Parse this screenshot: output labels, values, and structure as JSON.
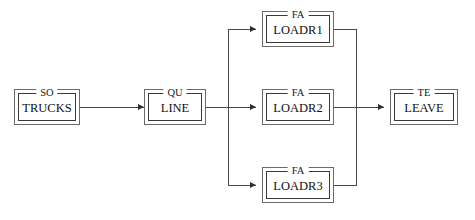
{
  "diagram": {
    "line_color": "#4a4a4a",
    "arrow_color": "#2f2f2f",
    "box_outer_color": "#6b6b6b",
    "box_inner_color": "#3a3a3a",
    "background": "#ffffff"
  },
  "nodes": [
    {
      "id": "trucks",
      "type": "SO",
      "label": "TRUCKS",
      "x": 14,
      "y": 89,
      "w": 66,
      "h": 36
    },
    {
      "id": "line",
      "type": "QU",
      "label": "LINE",
      "x": 144,
      "y": 89,
      "w": 62,
      "h": 36
    },
    {
      "id": "loadr1",
      "type": "FA",
      "label": "LOADR1",
      "x": 262,
      "y": 11,
      "w": 72,
      "h": 36
    },
    {
      "id": "loadr2",
      "type": "FA",
      "label": "LOADR2",
      "x": 262,
      "y": 89,
      "w": 72,
      "h": 36
    },
    {
      "id": "loadr3",
      "type": "FA",
      "label": "LOADR3",
      "x": 262,
      "y": 167,
      "w": 72,
      "h": 36
    },
    {
      "id": "leave",
      "type": "TE",
      "label": "LEAVE",
      "x": 390,
      "y": 89,
      "w": 68,
      "h": 36
    }
  ],
  "edges": [
    {
      "id": "trucks-to-line",
      "from": "trucks",
      "to": "line"
    },
    {
      "id": "line-to-loadr1",
      "from": "line",
      "to": "loadr1"
    },
    {
      "id": "line-to-loadr2",
      "from": "line",
      "to": "loadr2"
    },
    {
      "id": "line-to-loadr3",
      "from": "line",
      "to": "loadr3"
    },
    {
      "id": "loadr1-to-leave",
      "from": "loadr1",
      "to": "leave"
    },
    {
      "id": "loadr2-to-leave",
      "from": "loadr2",
      "to": "leave"
    },
    {
      "id": "loadr3-to-leave",
      "from": "loadr3",
      "to": "leave"
    }
  ],
  "geometry": {
    "mid_y": 107,
    "top_y": 29,
    "bottom_y": 185,
    "fanout_bus_x": 228,
    "merge_bus_x": 356
  }
}
